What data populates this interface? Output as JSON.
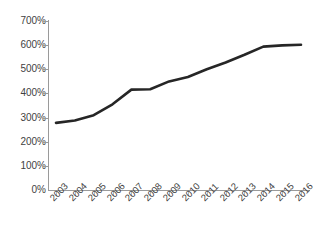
{
  "chart_data": {
    "type": "line",
    "title": "",
    "subtitle": "",
    "xlabel": "",
    "ylabel": "",
    "categories": [
      "2003",
      "2004",
      "2005",
      "2006",
      "2007",
      "2008",
      "2009",
      "2010",
      "2011",
      "2012",
      "2013",
      "2014",
      "2015",
      "2016"
    ],
    "series": [
      {
        "name": "",
        "values": [
          278,
          288,
          310,
          355,
          416,
          417,
          450,
          468,
          500,
          528,
          560,
          594,
          599,
          602
        ],
        "color": "#262626",
        "line_width": 2.6
      }
    ],
    "ylim": [
      0,
      700
    ],
    "ytick_values": [
      0,
      100,
      200,
      300,
      400,
      500,
      600,
      700
    ],
    "ytick_labels": [
      "0%",
      "100%",
      "200%",
      "300%",
      "400%",
      "500%",
      "600%",
      "700%"
    ],
    "grid": false,
    "legend": false,
    "legend_position": "none",
    "xtick_rotation": -45,
    "axis_color": "#9a9a9a",
    "text_color": "#3f3f3f",
    "background_color": "#ffffff"
  }
}
